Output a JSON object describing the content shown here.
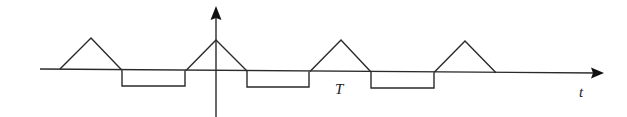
{
  "figure": {
    "labels": {
      "period": "T",
      "time_axis": "t"
    },
    "colors": {
      "stroke": "#2a2a2a",
      "background": "#ffffff"
    },
    "axes": {
      "horizontal": {
        "x1": 40,
        "y1": 69,
        "x2": 598,
        "y2": 73
      },
      "vertical": {
        "x": 216,
        "y_top": 10,
        "y_bottom": 117
      }
    },
    "waveform": {
      "description": "periodic waveform: triangular positive pulses alternating with negative rectangular pulses",
      "triangles": [
        {
          "x_start": 60,
          "x_apex": 91,
          "x_end": 122,
          "apex_y": 38
        },
        {
          "x_start": 186,
          "x_apex": 216,
          "x_end": 247,
          "apex_y": 40
        },
        {
          "x_start": 310,
          "x_apex": 341,
          "x_end": 371,
          "apex_y": 40
        },
        {
          "x_start": 434,
          "x_apex": 465,
          "x_end": 496,
          "apex_y": 41
        }
      ],
      "rectangles": [
        {
          "x_start": 122,
          "x_end": 185,
          "bottom_y": 86
        },
        {
          "x_start": 247,
          "x_end": 309,
          "bottom_y": 87
        },
        {
          "x_start": 371,
          "x_end": 434,
          "bottom_y": 88
        }
      ]
    }
  }
}
